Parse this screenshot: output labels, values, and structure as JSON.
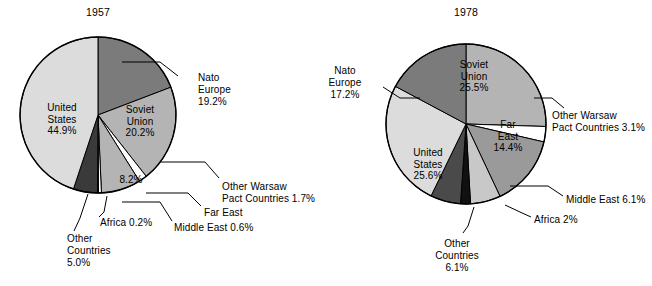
{
  "charts": [
    {
      "id": "chart-1957",
      "title": "1957",
      "center": {
        "x": 98,
        "y": 115
      },
      "radius": 78,
      "start_angle": 0,
      "slices": [
        {
          "name": "Nato Europe",
          "value": 19.2,
          "color": "#7b7b7b",
          "label": "Nato\nEurope\n19.2%"
        },
        {
          "name": "Soviet Union",
          "value": 20.2,
          "color": "#b4b4b4",
          "label": "Soviet\nUnion\n20.2%"
        },
        {
          "name": "Other Warsaw Pact Countries",
          "value": 1.7,
          "color": "#ffffff",
          "label": "Other Warsaw\nPact Countries 1.7%"
        },
        {
          "name": "Far East",
          "value": 8.2,
          "color": "#b4b4b4",
          "label": "Far East"
        },
        {
          "name": "Middle East",
          "value": 0.6,
          "color": "#ffffff",
          "label": "Middle East 0.6%"
        },
        {
          "name": "Africa",
          "value": 0.2,
          "color": "#ffffff",
          "label": "Africa 0.2%"
        },
        {
          "name": "Other Countries",
          "value": 5.0,
          "color": "#3a3a3a",
          "label": "Other\nCountries\n5.0%"
        },
        {
          "name": "United States",
          "value": 44.9,
          "color": "#dcdcdc",
          "label": "United\nStates\n44.9%"
        }
      ],
      "inner_labels": [
        {
          "for": "United States",
          "lines": [
            "United",
            "States",
            "44.9%"
          ],
          "x": 62,
          "y": 111
        },
        {
          "for": "Soviet Union",
          "lines": [
            "Soviet",
            "Union",
            "20.2%"
          ],
          "x": 140,
          "y": 113
        },
        {
          "for": "Far East",
          "lines": [
            "8.2%"
          ],
          "x": 131,
          "y": 183
        }
      ],
      "callouts": [
        {
          "for": "Nato Europe",
          "lines": [
            "Nato",
            "Europe",
            "19.2%"
          ],
          "x": 198,
          "y": 81,
          "align": "start"
        },
        {
          "for": "Other Warsaw Pact Countries",
          "lines": [
            "Other Warsaw",
            "Pact Countries 1.7%"
          ],
          "x": 222,
          "y": 190,
          "align": "start"
        },
        {
          "for": "Far East",
          "lines": [
            "Far East"
          ],
          "x": 204,
          "y": 216,
          "align": "start"
        },
        {
          "for": "Middle East",
          "lines": [
            "Middle East 0.6%"
          ],
          "x": 174,
          "y": 231,
          "align": "start"
        },
        {
          "for": "Africa",
          "lines": [
            "Africa 0.2%"
          ],
          "x": 100,
          "y": 226,
          "align": "start"
        },
        {
          "for": "Other Countries",
          "lines": [
            "Other",
            "Countries",
            "5.0%"
          ],
          "x": 67,
          "y": 242,
          "align": "start"
        }
      ]
    },
    {
      "id": "chart-1978",
      "title": "1978",
      "center": {
        "x": 466,
        "y": 124
      },
      "radius": 80,
      "start_angle": 0,
      "slices": [
        {
          "name": "Soviet Union",
          "value": 25.5,
          "color": "#b4b4b4",
          "label": "Soviet\nUnion\n25.5%"
        },
        {
          "name": "Other Warsaw Pact Countries",
          "value": 3.1,
          "color": "#ffffff",
          "label": "Other Warsaw\nPact Countries 3.1%"
        },
        {
          "name": "Far East",
          "value": 14.4,
          "color": "#9a9a9a",
          "label": "Far\nEast\n14.4%"
        },
        {
          "name": "Middle East",
          "value": 6.1,
          "color": "#c8c8c8",
          "label": "Middle East 6.1%"
        },
        {
          "name": "Africa",
          "value": 2.0,
          "color": "#111111",
          "label": "Africa 2%"
        },
        {
          "name": "Other Countries",
          "value": 6.1,
          "color": "#4a4a4a",
          "label": "Other\nCountries\n6.1%"
        },
        {
          "name": "United States",
          "value": 25.6,
          "color": "#dcdcdc",
          "label": "United\nStates\n25.6%"
        },
        {
          "name": "Nato Europe",
          "value": 17.2,
          "color": "#7b7b7b",
          "label": "Nato\nEurope\n17.2%"
        }
      ],
      "inner_labels": [
        {
          "for": "Soviet Union",
          "lines": [
            "Soviet",
            "Union",
            "25.5%"
          ],
          "x": 474,
          "y": 68
        },
        {
          "for": "Far East",
          "lines": [
            "Far",
            "East",
            "14.4%"
          ],
          "x": 508,
          "y": 128
        },
        {
          "for": "United States",
          "lines": [
            "United",
            "States",
            "25.6%"
          ],
          "x": 428,
          "y": 156
        }
      ],
      "callouts": [
        {
          "for": "Nato Europe",
          "lines": [
            "Nato",
            "Europe",
            "17.2%"
          ],
          "x": 345,
          "y": 74,
          "align": "middle"
        },
        {
          "for": "Other Warsaw Pact Countries",
          "lines": [
            "Other Warsaw",
            "Pact Countries 3.1%"
          ],
          "x": 552,
          "y": 119,
          "align": "start"
        },
        {
          "for": "Middle East",
          "lines": [
            "Middle East 6.1%"
          ],
          "x": 566,
          "y": 203,
          "align": "start"
        },
        {
          "for": "Africa",
          "lines": [
            "Africa 2%"
          ],
          "x": 534,
          "y": 223,
          "align": "start"
        },
        {
          "for": "Other Countries",
          "lines": [
            "Other",
            "Countries",
            "6.1%"
          ],
          "x": 457,
          "y": 247,
          "align": "middle"
        }
      ]
    }
  ],
  "chart_data": [
    {
      "type": "pie",
      "title": "1957",
      "categories": [
        "United States",
        "Soviet Union",
        "Nato Europe",
        "Far East",
        "Other Countries",
        "Other Warsaw Pact Countries",
        "Middle East",
        "Africa"
      ],
      "values": [
        44.9,
        20.2,
        19.2,
        8.2,
        5.0,
        1.7,
        0.6,
        0.2
      ],
      "unit": "percent",
      "legend": "none",
      "labels_inside": [
        "United States 44.9%",
        "Soviet Union 20.2%",
        "8.2%"
      ],
      "labels_outside": [
        "Nato Europe 19.2%",
        "Other Warsaw Pact Countries 1.7%",
        "Far East",
        "Middle East 0.6%",
        "Africa 0.2%",
        "Other Countries 5.0%"
      ]
    },
    {
      "type": "pie",
      "title": "1978",
      "categories": [
        "United States",
        "Soviet Union",
        "Nato Europe",
        "Far East",
        "Other Countries",
        "Middle East",
        "Other Warsaw Pact Countries",
        "Africa"
      ],
      "values": [
        25.6,
        25.5,
        17.2,
        14.4,
        6.1,
        6.1,
        3.1,
        2.0
      ],
      "unit": "percent",
      "legend": "none",
      "labels_inside": [
        "Soviet Union 25.5%",
        "Far East 14.4%",
        "United States 25.6%"
      ],
      "labels_outside": [
        "Nato Europe 17.2%",
        "Other Warsaw Pact Countries 3.1%",
        "Middle East 6.1%",
        "Africa 2%",
        "Other Countries 6.1%"
      ]
    }
  ],
  "titles": {
    "left": "1957",
    "right": "1978"
  }
}
